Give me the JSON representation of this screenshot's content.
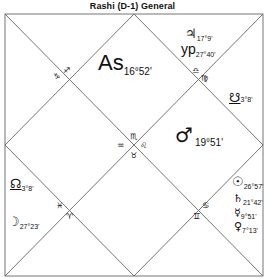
{
  "title": "Rashi (D-1) General",
  "chart_type": "North Indian diamond horoscope chart",
  "houses": [
    {
      "house": 1,
      "sign_number": 12,
      "sign_glyph": "♓",
      "contents": [
        {
          "symbol": "As",
          "name": "Ascendant",
          "degree": "16°52'"
        }
      ]
    },
    {
      "house": 2,
      "sign_number": 1,
      "sign_glyph": "♈",
      "contents": []
    },
    {
      "house": 3,
      "sign_number": 2,
      "sign_glyph": "♉",
      "contents": []
    },
    {
      "house": 4,
      "sign_number": 3,
      "sign_glyph": "♊",
      "contents": []
    },
    {
      "house": 5,
      "sign_number": 4,
      "sign_glyph": "♋",
      "contents": []
    },
    {
      "house": 6,
      "sign_number": 5,
      "sign_glyph": "♌",
      "contents": []
    },
    {
      "house": 7,
      "sign_number": 6,
      "sign_glyph": "♍",
      "contents": []
    },
    {
      "house": 8,
      "sign_number": 7,
      "sign_glyph": "♎",
      "contents": []
    },
    {
      "house": 9,
      "sign_number": 8,
      "sign_glyph": "♏",
      "contents": []
    },
    {
      "house": 10,
      "sign_number": 9,
      "sign_glyph": "♐",
      "contents": []
    },
    {
      "house": 11,
      "sign_number": 10,
      "sign_glyph": "♑",
      "contents": []
    },
    {
      "house": 12,
      "sign_number": 11,
      "sign_glyph": "♒",
      "contents": []
    }
  ],
  "labels": {
    "ascendant": {
      "symbol": "As",
      "degree": "16°52'"
    },
    "jupiter": {
      "symbol": "♃",
      "degree": "17°9'"
    },
    "yogi_point": {
      "symbol": "yp",
      "degree": "27°40'"
    },
    "ketu": {
      "symbol": "☋",
      "degree": "3°8'"
    },
    "mars": {
      "symbol": "♂",
      "degree": "19°51'"
    },
    "rahu": {
      "symbol": "☊",
      "degree": "3°8'"
    },
    "moon": {
      "symbol": "☽",
      "degree": "27°23'"
    },
    "sun": {
      "symbol": "☉",
      "degree": "26°57'"
    },
    "saturn": {
      "symbol": "♄",
      "degree": "21°42'"
    },
    "mercury": {
      "symbol": "☿",
      "degree": "9°51'"
    },
    "venus": {
      "symbol": "♀",
      "degree": "7°13'"
    }
  },
  "sign_markers": {
    "top_left_a": "♐",
    "top_left_b": "♑",
    "top_right_a": "♎",
    "top_right_b": "♍",
    "center_top": "♏",
    "center_left": "♒",
    "center_right": "♌",
    "center_bottom": "♉",
    "bottom_left_a": "♓",
    "bottom_left_b": "♈",
    "bottom_right_a": "♋",
    "bottom_right_b": "♊"
  },
  "colors": {
    "line": "#555555",
    "text": "#111111",
    "background": "#ffffff"
  }
}
